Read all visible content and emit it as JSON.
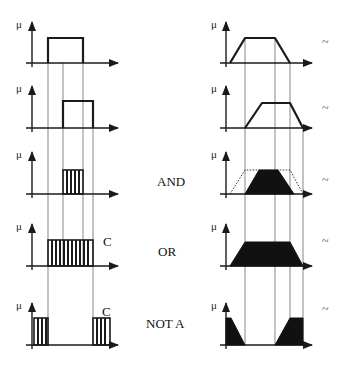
{
  "diagram": {
    "axis_label": "μ",
    "columns": [
      "crisp sets",
      "fuzzy sets"
    ],
    "rows": [
      {
        "id": "A",
        "operation_label": "",
        "crisp_label": "",
        "fuzzy_marker": "~"
      },
      {
        "id": "B",
        "operation_label": "",
        "crisp_label": "",
        "fuzzy_marker": "~"
      },
      {
        "id": "and",
        "operation_label": "AND",
        "crisp_label": "",
        "fuzzy_marker": "~"
      },
      {
        "id": "or",
        "operation_label": "OR",
        "crisp_label": "C",
        "fuzzy_marker": "~"
      },
      {
        "id": "not",
        "operation_label": "NOT A",
        "crisp_label": "C",
        "fuzzy_marker": "~"
      }
    ],
    "colors": {
      "ink": "#1a1a1a",
      "guide": "#555555",
      "fill": "#111111",
      "background": "#ffffff"
    }
  }
}
